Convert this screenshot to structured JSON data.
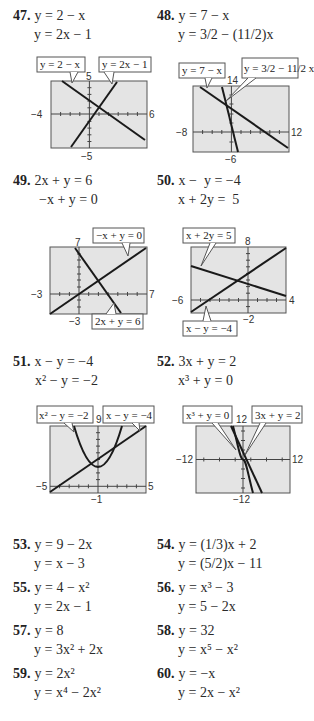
{
  "problems": [
    {
      "number": "47.",
      "eq1": "y = 2 − x",
      "eq2": "y = 2x − 1"
    },
    {
      "number": "48.",
      "eq1": "y = 7 − x",
      "eq2": "y = 3/2 − (11/2)x"
    },
    {
      "number": "49.",
      "eq1": "2x + y = 6",
      "eq2": "−x + y = 0"
    },
    {
      "number": "50.",
      "eq1": "x −  y = −4",
      "eq2": "x + 2y =  5"
    },
    {
      "number": "51.",
      "eq1": "x − y = −4",
      "eq2": "x² − y = −2"
    },
    {
      "number": "52.",
      "eq1": "3x + y = 2",
      "eq2": "x³ + y = 0"
    },
    {
      "number": "53.",
      "eq1": "y = 9 − 2x",
      "eq2": "y = x − 3"
    },
    {
      "number": "54.",
      "eq1": "y = (1/3)x + 2",
      "eq2": "y = (5/2)x − 11"
    },
    {
      "number": "55.",
      "eq1": "y = 4 − x²",
      "eq2": "y = 2x − 1"
    },
    {
      "number": "56.",
      "eq1": "y = x³ − 3",
      "eq2": "y = 5 − 2x"
    },
    {
      "number": "57.",
      "eq1": "y = 8",
      "eq2": "y = 3x² + 2x"
    },
    {
      "number": "58.",
      "eq1": "y = 32",
      "eq2": "y = x⁵ − x²"
    },
    {
      "number": "59.",
      "eq1": "y = 2x²",
      "eq2": "y = x⁴ − 2x²"
    },
    {
      "number": "60.",
      "eq1": "y = −x",
      "eq2": "y = 2x − x²"
    }
  ],
  "graphs": {
    "g47": {
      "xmin": "−4",
      "xmax": "6",
      "ymax": "5",
      "ymin": "−5",
      "callouts": [
        "y = 2 − x",
        "y = 2x − 1"
      ]
    },
    "g48": {
      "xmin": "−8",
      "xmax": "12",
      "ymax": "14",
      "ymin": "−6",
      "callouts": [
        "y = 7 − x",
        "y = 3/2 − 11/2 x"
      ]
    },
    "g49": {
      "xmin": "−3",
      "xmax": "7",
      "ymax": "7",
      "ymin": "−3",
      "callouts": [
        "−x + y = 0",
        "2x + y = 6"
      ]
    },
    "g50": {
      "xmin": "−6",
      "xmax": "4",
      "ymax": "8",
      "ymin": "−2",
      "callouts": [
        "x + 2y = 5",
        "x − y = −4"
      ]
    },
    "g51": {
      "xmin": "−5",
      "xmax": "5",
      "ymax": "9",
      "ymin": "−1",
      "callouts": [
        "x² − y = −2",
        "x − y = −4"
      ]
    },
    "g52": {
      "xmin": "−12",
      "xmax": "12",
      "ymax": "12",
      "ymin": "−12",
      "callouts": [
        "x³ + y = 0",
        "3x + y = 2"
      ]
    }
  },
  "colors": {
    "screen_bg": "#e4e4e4",
    "curve": "#1a1a1a",
    "frame": "#555555"
  }
}
